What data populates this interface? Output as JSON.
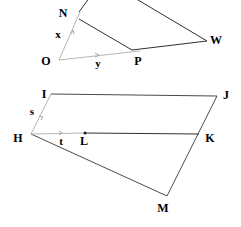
{
  "diagram": {
    "colors": {
      "stroke_dark": "#303030",
      "stroke_mid": "#4a4a4a",
      "stroke_light": "#b5b5b5",
      "label": "#000000",
      "background": "#ffffff"
    },
    "upper_figure": {
      "name": "ray-and-quadrilateral-ONPW",
      "vertex_labels": [
        {
          "id": "N",
          "text": "N",
          "x": 63,
          "y": 17
        },
        {
          "id": "W",
          "text": "W",
          "x": 216,
          "y": 44
        },
        {
          "id": "O",
          "text": "O",
          "x": 46,
          "y": 65
        },
        {
          "id": "P",
          "text": "P",
          "x": 138,
          "y": 65
        }
      ],
      "variable_labels": [
        {
          "id": "x",
          "text": "x",
          "x": 58,
          "y": 38
        },
        {
          "id": "y",
          "text": "y",
          "x": 98,
          "y": 67
        }
      ]
    },
    "lower_figure": {
      "name": "quadrilateral-IJMH-with-segment-HK",
      "vertex_labels": [
        {
          "id": "I",
          "text": "I",
          "x": 44,
          "y": 98
        },
        {
          "id": "J",
          "text": "J",
          "x": 226,
          "y": 99
        },
        {
          "id": "H",
          "text": "H",
          "x": 18,
          "y": 142
        },
        {
          "id": "K",
          "text": "K",
          "x": 210,
          "y": 142
        },
        {
          "id": "L",
          "text": "L",
          "x": 84,
          "y": 145
        },
        {
          "id": "M",
          "text": "M",
          "x": 163,
          "y": 212
        }
      ],
      "variable_labels": [
        {
          "id": "s",
          "text": "s",
          "x": 32,
          "y": 115
        },
        {
          "id": "t",
          "text": "t",
          "x": 61,
          "y": 145
        }
      ]
    }
  }
}
